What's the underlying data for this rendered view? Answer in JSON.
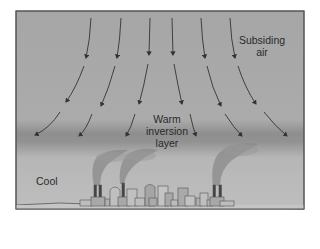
{
  "diagram": {
    "type": "temperature-inversion",
    "labels": {
      "subsiding_air_line1": "Subsiding",
      "subsiding_air_line2": "air",
      "warm_line1": "Warm",
      "warm_line2": "inversion",
      "warm_line3": "layer",
      "cool": "Cool"
    },
    "colors": {
      "upper_air": "#a9a9a9",
      "inversion_band": "#8c8c8c",
      "cool_air": "#bdbdbd",
      "ground": "#c6c6c6",
      "frame": "#555555",
      "arrows": "#333333",
      "smoke": "#8a8a8a",
      "buildings": "#b2b2b2"
    }
  }
}
